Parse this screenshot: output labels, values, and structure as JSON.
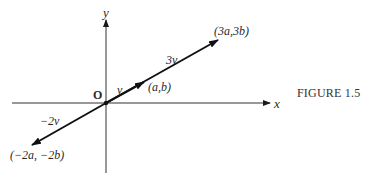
{
  "figure": {
    "caption": "FIGURE 1.5",
    "axes": {
      "x_label": "x",
      "y_label": "y",
      "origin_label": "O"
    },
    "vectors": [
      {
        "name": "v",
        "label": "v⃗",
        "endpoint_label": "(a,b)",
        "scale": 1
      },
      {
        "name": "3v",
        "label": "3v⃗",
        "endpoint_label": "(3a,3b)",
        "scale": 3
      },
      {
        "name": "-2v",
        "label": "−2v⃗",
        "endpoint_label": "(−2a, −2b)",
        "scale": -2
      }
    ],
    "colors": {
      "ink": "#1a1a1a",
      "background": "#ffffff"
    }
  }
}
